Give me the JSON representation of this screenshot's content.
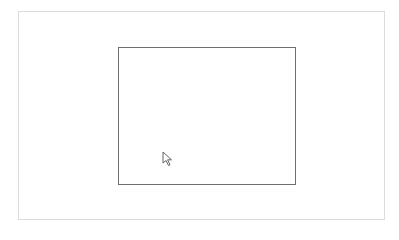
{
  "window": {
    "frame_border_color": "#dcdcdc"
  },
  "canvas": {
    "rectangle_border_color": "#6e6e6e"
  },
  "cursor": {
    "icon": "arrow-pointer-icon"
  }
}
